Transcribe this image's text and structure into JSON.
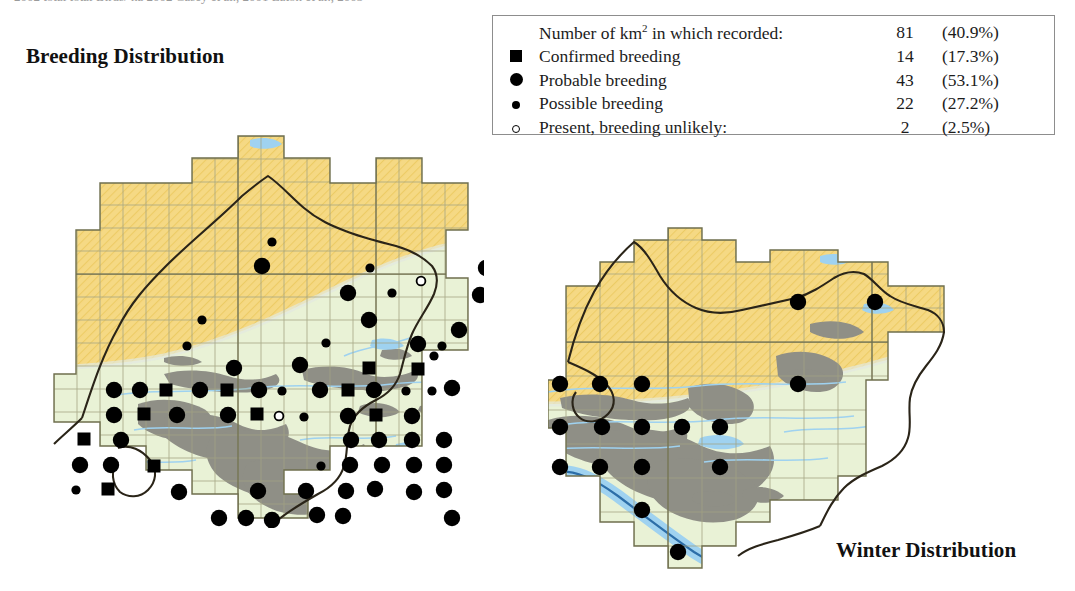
{
  "page": {
    "cropped_header_text": "2002   total    total   Birds/ ha   2002   Casey et al., 2001   Eaton et al., 2003"
  },
  "breeding": {
    "title": "Breeding Distribution"
  },
  "winter": {
    "title": "Winter Distribution"
  },
  "legend": {
    "header": {
      "label_pre": "Number of km",
      "label_sup": "2",
      "label_post": " in which recorded:",
      "count": "81",
      "percent": "(40.9%)"
    },
    "rows": [
      {
        "symbol": "filled-square-icon",
        "label": "Confirmed breeding",
        "count": "14",
        "percent": "(17.3%)"
      },
      {
        "symbol": "large-filled-circle-icon",
        "label": "Probable breeding",
        "count": "43",
        "percent": "(53.1%)"
      },
      {
        "symbol": "small-filled-circle-icon",
        "label": "Possible breeding",
        "count": "22",
        "percent": "(27.2%)"
      },
      {
        "symbol": "open-circle-icon",
        "label": "Present, breeding unlikely:",
        "count": "2",
        "percent": "(2.5%)"
      }
    ]
  },
  "colors": {
    "upland_yellow": "#f6d984",
    "lowland_green": "#e9f2d6",
    "urban_grey": "#8f8f87",
    "water_blue": "#9fd2f0",
    "river_outline": "#2d6ea8",
    "boundary": "#2a2418",
    "grid": "#9a9a78",
    "marker": "#000000"
  },
  "chart_data": {
    "type": "map",
    "legend_position": "top-right",
    "grid": true,
    "maps": [
      {
        "name": "breeding",
        "title": "Breeding Distribution",
        "marker_classes": [
          "confirmed",
          "probable",
          "possible",
          "present"
        ],
        "totals": {
          "recorded": 81,
          "recorded_pct": 40.9,
          "confirmed": 14,
          "confirmed_pct": 17.3,
          "probable": 43,
          "probable_pct": 53.1,
          "possible": 22,
          "possible_pct": 27.2,
          "present": 2,
          "present_pct": 2.5
        },
        "markers": [
          {
            "x": 248,
            "y": 178,
            "t": "probable"
          },
          {
            "x": 258,
            "y": 154,
            "t": "possible"
          },
          {
            "x": 356,
            "y": 180,
            "t": "possible"
          },
          {
            "x": 334,
            "y": 205,
            "t": "probable"
          },
          {
            "x": 378,
            "y": 205,
            "t": "possible"
          },
          {
            "x": 472,
            "y": 180,
            "t": "probable"
          },
          {
            "x": 514,
            "y": 180,
            "t": "probable"
          },
          {
            "x": 466,
            "y": 207,
            "t": "probable"
          },
          {
            "x": 407,
            "y": 193,
            "t": "present"
          },
          {
            "x": 188,
            "y": 232,
            "t": "possible"
          },
          {
            "x": 355,
            "y": 232,
            "t": "probable"
          },
          {
            "x": 404,
            "y": 256,
            "t": "probable"
          },
          {
            "x": 428,
            "y": 258,
            "t": "possible"
          },
          {
            "x": 286,
            "y": 277,
            "t": "probable"
          },
          {
            "x": 355,
            "y": 280,
            "t": "confirmed"
          },
          {
            "x": 404,
            "y": 281,
            "t": "confirmed"
          },
          {
            "x": 100,
            "y": 302,
            "t": "probable"
          },
          {
            "x": 126,
            "y": 302,
            "t": "probable"
          },
          {
            "x": 152,
            "y": 302,
            "t": "confirmed"
          },
          {
            "x": 186,
            "y": 302,
            "t": "probable"
          },
          {
            "x": 213,
            "y": 302,
            "t": "confirmed"
          },
          {
            "x": 245,
            "y": 302,
            "t": "probable"
          },
          {
            "x": 268,
            "y": 303,
            "t": "possible"
          },
          {
            "x": 306,
            "y": 302,
            "t": "probable"
          },
          {
            "x": 334,
            "y": 302,
            "t": "confirmed"
          },
          {
            "x": 360,
            "y": 302,
            "t": "probable"
          },
          {
            "x": 392,
            "y": 303,
            "t": "possible"
          },
          {
            "x": 418,
            "y": 303,
            "t": "possible"
          },
          {
            "x": 100,
            "y": 327,
            "t": "probable"
          },
          {
            "x": 130,
            "y": 326,
            "t": "confirmed"
          },
          {
            "x": 163,
            "y": 327,
            "t": "probable"
          },
          {
            "x": 214,
            "y": 327,
            "t": "probable"
          },
          {
            "x": 243,
            "y": 326,
            "t": "confirmed"
          },
          {
            "x": 265,
            "y": 328,
            "t": "present"
          },
          {
            "x": 290,
            "y": 329,
            "t": "possible"
          },
          {
            "x": 334,
            "y": 328,
            "t": "probable"
          },
          {
            "x": 362,
            "y": 327,
            "t": "confirmed"
          },
          {
            "x": 398,
            "y": 328,
            "t": "probable"
          },
          {
            "x": 70,
            "y": 351,
            "t": "confirmed"
          },
          {
            "x": 107,
            "y": 352,
            "t": "probable"
          },
          {
            "x": 337,
            "y": 352,
            "t": "probable"
          },
          {
            "x": 365,
            "y": 352,
            "t": "probable"
          },
          {
            "x": 398,
            "y": 352,
            "t": "probable"
          },
          {
            "x": 66,
            "y": 377,
            "t": "probable"
          },
          {
            "x": 97,
            "y": 377,
            "t": "probable"
          },
          {
            "x": 140,
            "y": 378,
            "t": "confirmed"
          },
          {
            "x": 307,
            "y": 378,
            "t": "possible"
          },
          {
            "x": 336,
            "y": 377,
            "t": "probable"
          },
          {
            "x": 368,
            "y": 377,
            "t": "probable"
          },
          {
            "x": 400,
            "y": 377,
            "t": "probable"
          },
          {
            "x": 62,
            "y": 402,
            "t": "possible"
          },
          {
            "x": 94,
            "y": 401,
            "t": "confirmed"
          },
          {
            "x": 165,
            "y": 404,
            "t": "probable"
          },
          {
            "x": 244,
            "y": 403,
            "t": "probable"
          },
          {
            "x": 292,
            "y": 403,
            "t": "probable"
          },
          {
            "x": 332,
            "y": 403,
            "t": "probable"
          },
          {
            "x": 361,
            "y": 401,
            "t": "probable"
          },
          {
            "x": 400,
            "y": 404,
            "t": "probable"
          },
          {
            "x": 205,
            "y": 430,
            "t": "probable"
          },
          {
            "x": 232,
            "y": 430,
            "t": "probable"
          },
          {
            "x": 258,
            "y": 432,
            "t": "probable"
          },
          {
            "x": 303,
            "y": 427,
            "t": "probable"
          },
          {
            "x": 329,
            "y": 428,
            "t": "probable"
          },
          {
            "x": 205,
            "y": 452,
            "t": "probable"
          },
          {
            "x": 231,
            "y": 452,
            "t": "probable"
          },
          {
            "x": 258,
            "y": 452,
            "t": "confirmed"
          },
          {
            "x": 286,
            "y": 452,
            "t": "probable"
          },
          {
            "x": 227,
            "y": 476,
            "t": "probable"
          },
          {
            "x": 256,
            "y": 476,
            "t": "probable"
          },
          {
            "x": 283,
            "y": 477,
            "t": "possible"
          },
          {
            "x": 258,
            "y": 500,
            "t": "probable"
          },
          {
            "x": 445,
            "y": 242,
            "t": "probable"
          },
          {
            "x": 420,
            "y": 268,
            "t": "possible"
          },
          {
            "x": 438,
            "y": 430,
            "t": "probable"
          },
          {
            "x": 173,
            "y": 258,
            "t": "possible"
          },
          {
            "x": 312,
            "y": 255,
            "t": "possible"
          },
          {
            "x": 220,
            "y": 280,
            "t": "probable"
          },
          {
            "x": 438,
            "y": 300,
            "t": "probable"
          },
          {
            "x": 430,
            "y": 352,
            "t": "probable"
          },
          {
            "x": 430,
            "y": 377,
            "t": "probable"
          },
          {
            "x": 430,
            "y": 402,
            "t": "probable"
          }
        ]
      },
      {
        "name": "winter",
        "title": "Winter Distribution",
        "marker_classes": [
          "probable"
        ],
        "markers": [
          {
            "x": 250,
            "y": 80,
            "t": "probable"
          },
          {
            "x": 327,
            "y": 80,
            "t": "probable"
          },
          {
            "x": 12,
            "y": 162,
            "t": "probable"
          },
          {
            "x": 52,
            "y": 162,
            "t": "probable"
          },
          {
            "x": 94,
            "y": 162,
            "t": "probable"
          },
          {
            "x": 250,
            "y": 162,
            "t": "probable"
          },
          {
            "x": 12,
            "y": 205,
            "t": "probable"
          },
          {
            "x": 54,
            "y": 205,
            "t": "probable"
          },
          {
            "x": 94,
            "y": 205,
            "t": "probable"
          },
          {
            "x": 134,
            "y": 205,
            "t": "probable"
          },
          {
            "x": 172,
            "y": 205,
            "t": "probable"
          },
          {
            "x": 12,
            "y": 245,
            "t": "probable"
          },
          {
            "x": 52,
            "y": 245,
            "t": "probable"
          },
          {
            "x": 94,
            "y": 245,
            "t": "probable"
          },
          {
            "x": 172,
            "y": 245,
            "t": "probable"
          },
          {
            "x": 94,
            "y": 288,
            "t": "probable"
          },
          {
            "x": 130,
            "y": 330,
            "t": "probable"
          }
        ]
      }
    ]
  }
}
